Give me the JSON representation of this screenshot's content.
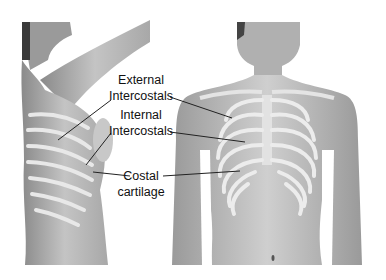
{
  "figure": {
    "left_view": "side view of torso with raised arm showing ribs",
    "right_view": "front view of torso showing rib cage"
  },
  "labels": {
    "external": {
      "line1": "External",
      "line2": "Intercostals"
    },
    "internal": {
      "line1": "Internal",
      "line2": "Intercostals"
    },
    "costal": {
      "line1": "Costal",
      "line2": "cartilage"
    }
  },
  "colors": {
    "skin": "#b8b8b8",
    "rib": "#e6e6e6",
    "shadow": "#7a7a7a",
    "leader": "#222222"
  }
}
